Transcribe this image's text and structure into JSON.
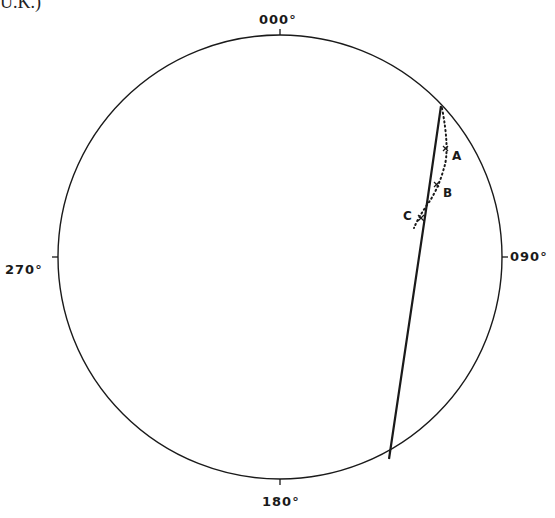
{
  "caption": "U.K.)",
  "stereonet": {
    "labels": {
      "north": "000°",
      "east": "090°",
      "south": "180°",
      "west": "270°"
    },
    "points": [
      {
        "name": "A",
        "label": "A"
      },
      {
        "name": "B",
        "label": "B"
      },
      {
        "name": "C",
        "label": "C"
      }
    ],
    "line_color": "#1a1a1a"
  }
}
